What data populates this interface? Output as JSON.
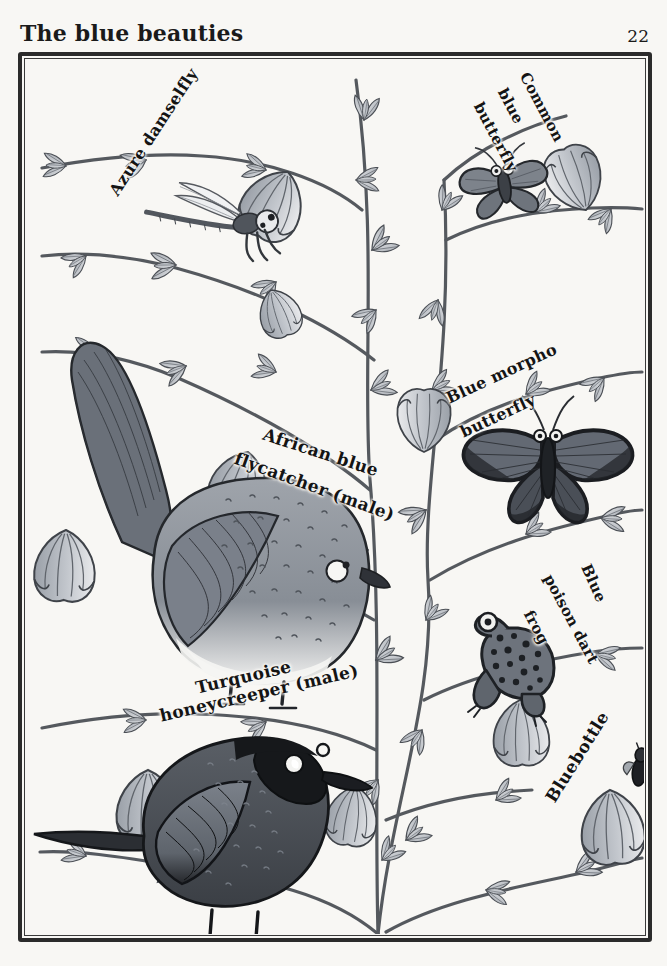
{
  "page": {
    "title": "The blue beauties",
    "number": "22",
    "background_color": "#f8f7f4",
    "ink_color": "#2b2b2b"
  },
  "plate": {
    "frame_style": "double-ruled hand-drawn border",
    "palette": {
      "paper": "#f8f7f4",
      "ink": "#2b2b2b",
      "mid_grey": "#8f9298",
      "light_grey": "#c9ccd1",
      "dark_grey": "#4a4d53",
      "near_black": "#1d1f22"
    },
    "labels": [
      {
        "id": "azure-damselfly",
        "lines": [
          "Azure damselfly"
        ]
      },
      {
        "id": "common-blue-butterfly",
        "lines": [
          "Common",
          "blue",
          "butterfly"
        ]
      },
      {
        "id": "african-blue-flycatcher",
        "lines": [
          "African blue",
          "flycatcher (male)"
        ]
      },
      {
        "id": "blue-morpho-butterfly",
        "lines": [
          "Blue morpho",
          "butterfly"
        ]
      },
      {
        "id": "blue-poison-dart-frog",
        "lines": [
          "Blue",
          "poison dart",
          "frog"
        ]
      },
      {
        "id": "turquoise-honeycreeper",
        "lines": [
          "Turquoise",
          "honeycreeper (male)"
        ]
      },
      {
        "id": "bluebottle",
        "lines": [
          "Bluebottle"
        ]
      }
    ],
    "specimens": [
      {
        "id": "azure-damselfly",
        "name": "Azure damselfly",
        "kind": "insect"
      },
      {
        "id": "common-blue-butterfly",
        "name": "Common blue butterfly",
        "kind": "insect"
      },
      {
        "id": "african-blue-flycatcher",
        "name": "African blue flycatcher (male)",
        "kind": "bird"
      },
      {
        "id": "blue-morpho-butterfly",
        "name": "Blue morpho butterfly",
        "kind": "insect"
      },
      {
        "id": "blue-poison-dart-frog",
        "name": "Blue poison dart frog",
        "kind": "amphibian"
      },
      {
        "id": "turquoise-honeycreeper",
        "name": "Turquoise honeycreeper (male)",
        "kind": "bird"
      },
      {
        "id": "bluebottle",
        "name": "Bluebottle",
        "kind": "insect"
      }
    ]
  }
}
